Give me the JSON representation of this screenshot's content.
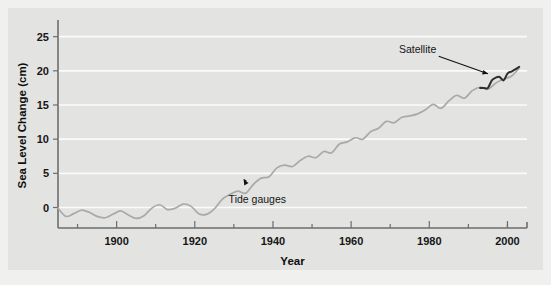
{
  "chart_data": {
    "type": "line",
    "title": "",
    "xlabel": "Year",
    "ylabel": "Sea Level Change (cm)",
    "xlim": [
      1885,
      2005
    ],
    "ylim": [
      -3,
      27
    ],
    "xticks": [
      1900,
      1920,
      1940,
      1960,
      1980,
      2000
    ],
    "xticklabels": [
      "1900",
      "1920",
      "1940",
      "1960",
      "1980",
      "2000"
    ],
    "xminorticks": [
      1890,
      1910,
      1930,
      1950,
      1970,
      1990,
      2000
    ],
    "yticks": [
      0,
      5,
      10,
      15,
      20,
      25
    ],
    "yticklabels": [
      "0",
      "5",
      "10",
      "15",
      "20",
      "25"
    ],
    "grid": "horizontal",
    "legend": "none",
    "annotations": [
      {
        "text": "Tide gauges",
        "label_x": 1936,
        "label_y": 0.6,
        "target_x": 1932,
        "target_y": 4.6
      },
      {
        "text": "Satellite",
        "label_x": 1977,
        "label_y": 22.6,
        "target_x": 1996,
        "target_y": 19.4
      }
    ],
    "series": [
      {
        "name": "Tide gauges",
        "color": "#a9a9a8",
        "x": [
          1885,
          1887,
          1889,
          1891,
          1893,
          1895,
          1897,
          1899,
          1901,
          1903,
          1905,
          1907,
          1909,
          1911,
          1913,
          1915,
          1917,
          1919,
          1921,
          1923,
          1925,
          1927,
          1929,
          1931,
          1933,
          1935,
          1937,
          1939,
          1941,
          1943,
          1945,
          1947,
          1949,
          1951,
          1953,
          1955,
          1957,
          1959,
          1961,
          1963,
          1965,
          1967,
          1969,
          1971,
          1973,
          1975,
          1977,
          1979,
          1981,
          1983,
          1985,
          1987,
          1989,
          1991,
          1993,
          1995,
          1997,
          1999,
          2001,
          2003
        ],
        "y": [
          -0.1,
          -1.3,
          -0.9,
          -0.4,
          -0.7,
          -1.3,
          -1.5,
          -1.0,
          -0.5,
          -1.1,
          -1.6,
          -1.2,
          -0.1,
          0.4,
          -0.3,
          -0.1,
          0.5,
          0.2,
          -0.9,
          -1.0,
          -0.2,
          1.2,
          1.9,
          2.4,
          2.1,
          3.4,
          4.3,
          4.5,
          5.8,
          6.2,
          6.0,
          6.9,
          7.5,
          7.3,
          8.2,
          8.0,
          9.3,
          9.6,
          10.2,
          10.0,
          11.1,
          11.6,
          12.6,
          12.4,
          13.2,
          13.4,
          13.7,
          14.3,
          15.1,
          14.5,
          15.6,
          16.4,
          16.0,
          17.1,
          17.6,
          17.3,
          18.2,
          18.8,
          19.2,
          20.4
        ]
      },
      {
        "name": "Satellite",
        "color": "#2d2d2d",
        "x": [
          1993,
          1994,
          1995,
          1996,
          1997,
          1998,
          1999,
          2000,
          2001,
          2002,
          2003
        ],
        "y": [
          17.5,
          17.5,
          17.5,
          18.6,
          19.0,
          19.1,
          18.6,
          19.6,
          19.9,
          20.2,
          20.6
        ]
      }
    ]
  }
}
